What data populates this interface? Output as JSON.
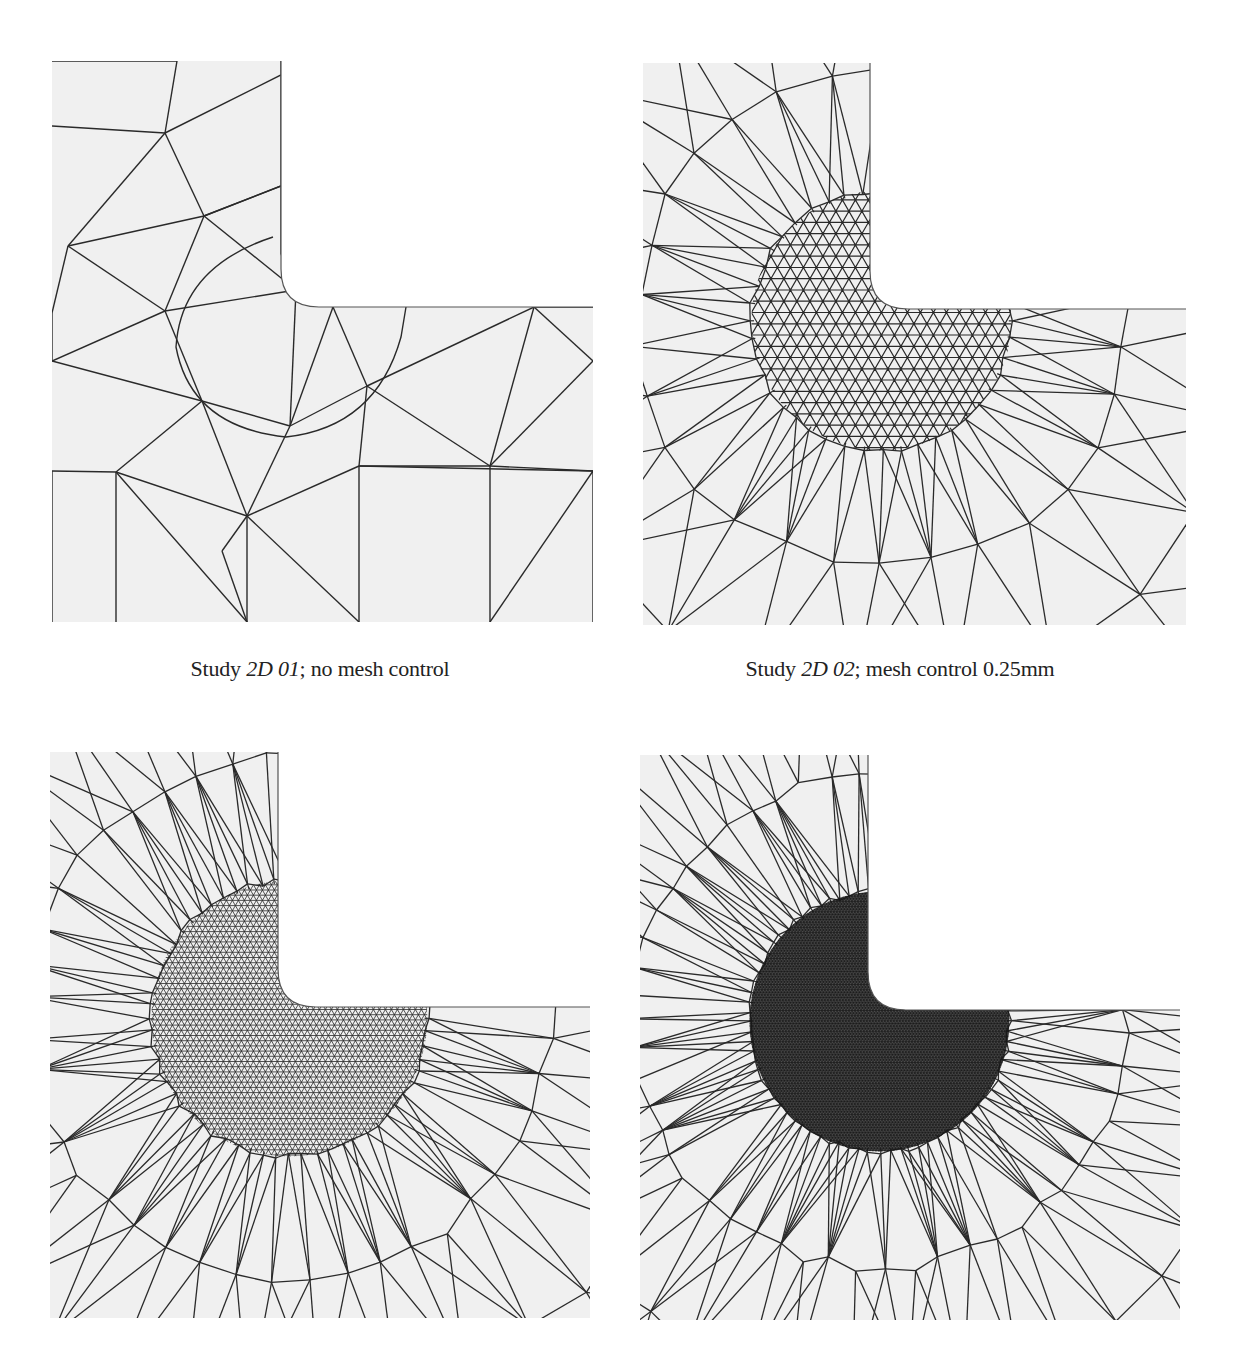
{
  "figure": {
    "background": "#ffffff",
    "mesh_fill": "#f0f0f0",
    "edge_color": "#2a2a2a",
    "panels": [
      {
        "id": "2d-01",
        "x": 52,
        "y": 61,
        "w": 541,
        "h": 561,
        "notch_x": 229,
        "notch_y": 246,
        "fillet_r": 38,
        "style": "coarse",
        "refine_radius": 0,
        "caption": {
          "prefix": "Study ",
          "italic": "2D 01",
          "suffix": "; no mesh control",
          "cx": 320,
          "cy": 656
        }
      },
      {
        "id": "2d-02",
        "x": 643,
        "y": 63,
        "w": 543,
        "h": 562,
        "notch_x": 227,
        "notch_y": 246,
        "fillet_r": 38,
        "style": "refined",
        "refine_radius": 130,
        "refine_spacing": 13,
        "rings": 4,
        "rays": 44,
        "caption": {
          "prefix": "Study ",
          "italic": "2D 02",
          "suffix": "; mesh control 0.25mm",
          "cx": 900,
          "cy": 656
        }
      },
      {
        "id": "2d-03",
        "x": 50,
        "y": 752,
        "w": 540,
        "h": 566,
        "notch_x": 228,
        "notch_y": 255,
        "fillet_r": 38,
        "style": "refined",
        "refine_radius": 138,
        "refine_spacing": 6,
        "rings": 5,
        "rays": 64,
        "caption": null
      },
      {
        "id": "2d-04",
        "x": 640,
        "y": 755,
        "w": 540,
        "h": 565,
        "notch_x": 228,
        "notch_y": 255,
        "fillet_r": 38,
        "style": "refined",
        "refine_radius": 130,
        "refine_spacing": 3,
        "rings": 5,
        "rays": 80,
        "caption": null
      }
    ],
    "coarse_nodes": [
      [
        0,
        0
      ],
      [
        125,
        0
      ],
      [
        229,
        0
      ],
      [
        0,
        65
      ],
      [
        113,
        72
      ],
      [
        229,
        14
      ],
      [
        229,
        125
      ],
      [
        16,
        185
      ],
      [
        152,
        155
      ],
      [
        229,
        193
      ],
      [
        0,
        252
      ],
      [
        113,
        250
      ],
      [
        244,
        229
      ],
      [
        281,
        246
      ],
      [
        0,
        300
      ],
      [
        150,
        340
      ],
      [
        238,
        365
      ],
      [
        315,
        325
      ],
      [
        0,
        410
      ],
      [
        64,
        411
      ],
      [
        195,
        455
      ],
      [
        307,
        405
      ],
      [
        438,
        405
      ],
      [
        482,
        246
      ],
      [
        541,
        246
      ],
      [
        541,
        300
      ],
      [
        541,
        410
      ],
      [
        541,
        561
      ],
      [
        0,
        561
      ],
      [
        64,
        561
      ],
      [
        195,
        561
      ],
      [
        307,
        561
      ],
      [
        438,
        561
      ],
      [
        255,
        370
      ],
      [
        170,
        490
      ]
    ],
    "coarse_edges": [
      [
        0,
        1
      ],
      [
        1,
        4
      ],
      [
        3,
        4
      ],
      [
        4,
        5
      ],
      [
        4,
        8
      ],
      [
        8,
        6
      ],
      [
        4,
        7
      ],
      [
        7,
        8
      ],
      [
        8,
        12
      ],
      [
        7,
        11
      ],
      [
        8,
        11
      ],
      [
        11,
        12
      ],
      [
        12,
        13
      ],
      [
        11,
        15
      ],
      [
        7,
        10
      ],
      [
        10,
        14
      ],
      [
        14,
        11
      ],
      [
        14,
        15
      ],
      [
        15,
        16
      ],
      [
        16,
        12
      ],
      [
        15,
        19
      ],
      [
        19,
        20
      ],
      [
        20,
        16
      ],
      [
        16,
        17
      ],
      [
        17,
        21
      ],
      [
        17,
        22
      ],
      [
        21,
        22
      ],
      [
        22,
        23
      ],
      [
        17,
        23
      ],
      [
        23,
        24
      ],
      [
        23,
        25
      ],
      [
        22,
        26
      ],
      [
        22,
        25
      ],
      [
        26,
        27
      ],
      [
        21,
        20
      ],
      [
        20,
        31
      ],
      [
        19,
        30
      ],
      [
        19,
        29
      ],
      [
        18,
        19
      ],
      [
        18,
        28
      ],
      [
        20,
        30
      ],
      [
        21,
        31
      ],
      [
        22,
        32
      ],
      [
        26,
        32
      ],
      [
        6,
        9
      ],
      [
        9,
        12
      ],
      [
        2,
        5
      ],
      [
        5,
        6
      ],
      [
        6,
        8
      ],
      [
        13,
        17
      ],
      [
        13,
        16
      ],
      [
        21,
        26
      ],
      [
        15,
        20
      ],
      [
        30,
        34
      ],
      [
        34,
        20
      ]
    ]
  }
}
